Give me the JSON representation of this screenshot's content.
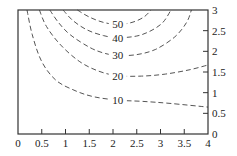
{
  "chart_data": {
    "type": "contour",
    "title": "",
    "xlabel": "",
    "ylabel": "",
    "xlim": [
      0,
      4
    ],
    "ylim": [
      0,
      3
    ],
    "y_axis_side": "right",
    "grid": false,
    "x_ticks": [
      "0",
      "0.5",
      "1",
      "1.5",
      "2",
      "2.5",
      "3",
      "3.5",
      "4"
    ],
    "x_tick_values": [
      0,
      0.5,
      1,
      1.5,
      2,
      2.5,
      3,
      3.5,
      4
    ],
    "y_ticks": [
      "0",
      "0.5",
      "1",
      "1.5",
      "2",
      "2.5",
      "3"
    ],
    "y_tick_values": [
      0,
      0.5,
      1,
      1.5,
      2,
      2.5,
      3
    ],
    "line_style": "dashed",
    "contours": [
      {
        "level": "10",
        "label_at": [
          2.1,
          0.82
        ],
        "points": [
          [
            0.19,
            3
          ],
          [
            0.3,
            2.4
          ],
          [
            0.5,
            1.75
          ],
          [
            0.8,
            1.3
          ],
          [
            1.2,
            1.05
          ],
          [
            1.6,
            0.9
          ],
          [
            2.1,
            0.82
          ],
          [
            2.6,
            0.79
          ],
          [
            3.2,
            0.74
          ],
          [
            4,
            0.65
          ]
        ]
      },
      {
        "level": "20",
        "label_at": [
          2.1,
          1.41
        ],
        "points": [
          [
            0.45,
            3
          ],
          [
            0.6,
            2.6
          ],
          [
            0.9,
            2.15
          ],
          [
            1.3,
            1.75
          ],
          [
            1.7,
            1.52
          ],
          [
            2.1,
            1.41
          ],
          [
            2.6,
            1.4
          ],
          [
            3.1,
            1.45
          ],
          [
            3.6,
            1.55
          ],
          [
            4,
            1.67
          ]
        ]
      },
      {
        "level": "30",
        "label_at": [
          2.1,
          1.9
        ],
        "points": [
          [
            0.67,
            3
          ],
          [
            0.85,
            2.7
          ],
          [
            1.1,
            2.4
          ],
          [
            1.5,
            2.1
          ],
          [
            1.8,
            1.96
          ],
          [
            2.1,
            1.9
          ],
          [
            2.5,
            1.92
          ],
          [
            2.9,
            2.05
          ],
          [
            3.3,
            2.35
          ],
          [
            3.55,
            2.7
          ],
          [
            3.65,
            3
          ]
        ]
      },
      {
        "level": "40",
        "label_at": [
          2.1,
          2.33
        ],
        "points": [
          [
            0.95,
            3
          ],
          [
            1.15,
            2.75
          ],
          [
            1.45,
            2.52
          ],
          [
            1.8,
            2.38
          ],
          [
            2.1,
            2.33
          ],
          [
            2.5,
            2.37
          ],
          [
            2.8,
            2.5
          ],
          [
            3.05,
            2.7
          ],
          [
            3.22,
            3
          ]
        ]
      },
      {
        "level": "50",
        "label_at": [
          2.1,
          2.65
        ],
        "points": [
          [
            1.25,
            3
          ],
          [
            1.5,
            2.83
          ],
          [
            1.8,
            2.7
          ],
          [
            2.1,
            2.65
          ],
          [
            2.4,
            2.7
          ],
          [
            2.65,
            2.83
          ],
          [
            2.8,
            3
          ]
        ]
      }
    ]
  }
}
